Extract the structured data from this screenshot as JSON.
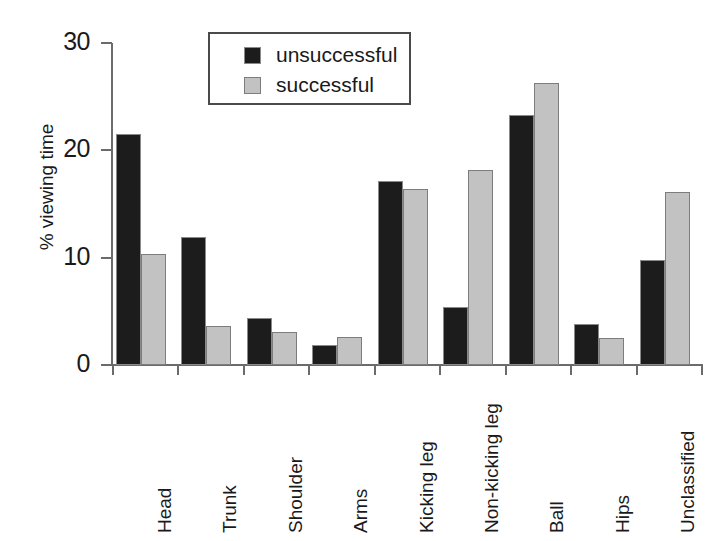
{
  "chart_data": {
    "type": "bar",
    "title": "",
    "xlabel": "",
    "ylabel": "% viewing time",
    "ylim": [
      0,
      30
    ],
    "yticks": [
      0,
      10,
      20,
      30
    ],
    "ytick_labels": [
      "0",
      "10",
      "20",
      "30"
    ],
    "grid": false,
    "legend_position": "top-center",
    "categories": [
      "Head",
      "Trunk",
      "Shoulder",
      "Arms",
      "Kicking leg",
      "Non-kicking leg",
      "Ball",
      "Hips",
      "Unclassified"
    ],
    "series": [
      {
        "name": "unsuccessful",
        "color": "#1c1c1c",
        "values": [
          21.5,
          11.9,
          4.4,
          1.9,
          17.1,
          5.4,
          23.3,
          3.8,
          9.8
        ]
      },
      {
        "name": "successful",
        "color": "#c2c2c2",
        "values": [
          10.3,
          3.6,
          3.1,
          2.6,
          16.4,
          18.2,
          26.3,
          2.5,
          16.1
        ]
      }
    ]
  },
  "legend": {
    "items": [
      {
        "label": "unsuccessful",
        "swatch": "unsuccessful"
      },
      {
        "label": "successful",
        "swatch": "successful"
      }
    ]
  },
  "colors": {
    "unsuccessful": "#1c1c1c",
    "successful": "#c2c2c2",
    "axis": "#6b6b6b",
    "text": "#1a1a1a",
    "background": "#ffffff"
  }
}
